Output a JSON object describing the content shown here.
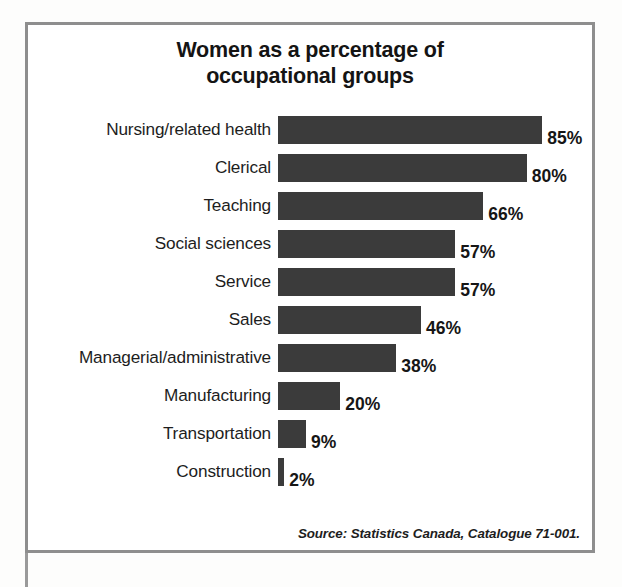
{
  "chart_data": {
    "type": "bar",
    "orientation": "horizontal",
    "title": "Women as a percentage of occupational groups",
    "title_lines": [
      "Women as a percentage of",
      "occupational groups"
    ],
    "xlabel": "",
    "ylabel": "",
    "xlim": [
      0,
      100
    ],
    "grid": false,
    "legend": null,
    "value_suffix": "%",
    "categories": [
      "Nursing/related health",
      "Clerical",
      "Teaching",
      "Social sciences",
      "Service",
      "Sales",
      "Managerial/administrative",
      "Manufacturing",
      "Transportation",
      "Construction"
    ],
    "values": [
      85,
      80,
      66,
      57,
      57,
      46,
      38,
      20,
      9,
      2
    ],
    "value_labels": [
      "85%",
      "80%",
      "66%",
      "57%",
      "57%",
      "46%",
      "38%",
      "20%",
      "9%",
      "2%"
    ],
    "bars": [
      {
        "category": "Nursing/related health",
        "value": 85,
        "label": "85%"
      },
      {
        "category": "Clerical",
        "value": 80,
        "label": "80%"
      },
      {
        "category": "Teaching",
        "value": 66,
        "label": "66%"
      },
      {
        "category": "Social sciences",
        "value": 57,
        "label": "57%"
      },
      {
        "category": "Service",
        "value": 57,
        "label": "57%"
      },
      {
        "category": "Sales",
        "value": 46,
        "label": "46%"
      },
      {
        "category": "Managerial/administrative",
        "value": 38,
        "label": "38%"
      },
      {
        "category": "Manufacturing",
        "value": 20,
        "label": "20%"
      },
      {
        "category": "Transportation",
        "value": 9,
        "label": "9%"
      },
      {
        "category": "Construction",
        "value": 2,
        "label": "2%"
      }
    ],
    "source_note": "Source: Statistics Canada, Catalogue 71-001.",
    "colors": {
      "bar_fill": "#3b3b3b",
      "frame_border": "#8e8e8e",
      "background": "#ffffff",
      "text": "#1d1d1d",
      "title_text": "#141414"
    }
  }
}
